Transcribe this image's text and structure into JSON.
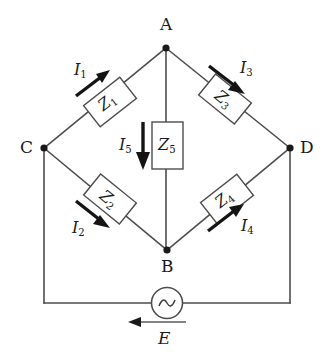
{
  "figure": {
    "type": "circuit-diagram",
    "name": "ac-bridge-circuit"
  },
  "nodes": [
    {
      "id": "A",
      "label": "A",
      "x": 166,
      "y": 48
    },
    {
      "id": "B",
      "label": "B",
      "x": 167,
      "y": 250
    },
    {
      "id": "C",
      "label": "C",
      "x": 44,
      "y": 148
    },
    {
      "id": "D",
      "label": "D",
      "x": 290,
      "y": 148
    }
  ],
  "components": [
    {
      "id": "Z1",
      "letter": "Z",
      "sub": "1",
      "branch": "C-A",
      "angle": -38
    },
    {
      "id": "Z2",
      "letter": "Z",
      "sub": "2",
      "branch": "C-B",
      "angle": 39
    },
    {
      "id": "Z3",
      "letter": "Z",
      "sub": "3",
      "branch": "A-D",
      "angle": 39
    },
    {
      "id": "Z4",
      "letter": "Z",
      "sub": "4",
      "branch": "B-D",
      "angle": -38
    },
    {
      "id": "Z5",
      "letter": "Z",
      "sub": "5",
      "branch": "A-B",
      "angle": 0
    }
  ],
  "currents": [
    {
      "id": "I1",
      "letter": "I",
      "sub": "1",
      "branch": "C-A",
      "direction": "up-right"
    },
    {
      "id": "I2",
      "letter": "I",
      "sub": "2",
      "branch": "C-B",
      "direction": "down-right"
    },
    {
      "id": "I3",
      "letter": "I",
      "sub": "3",
      "branch": "A-D",
      "direction": "down-right"
    },
    {
      "id": "I4",
      "letter": "I",
      "sub": "4",
      "branch": "B-D",
      "direction": "up-right"
    },
    {
      "id": "I5",
      "letter": "I",
      "sub": "5",
      "branch": "A-B",
      "direction": "down"
    }
  ],
  "source": {
    "id": "E",
    "label": "E",
    "symbol": "ac-sine",
    "polarity_direction": "left"
  },
  "colors": {
    "wire": "#4d4d4d",
    "text": "#1a1a1a",
    "arrow": "#141414",
    "background": "#ffffff"
  }
}
